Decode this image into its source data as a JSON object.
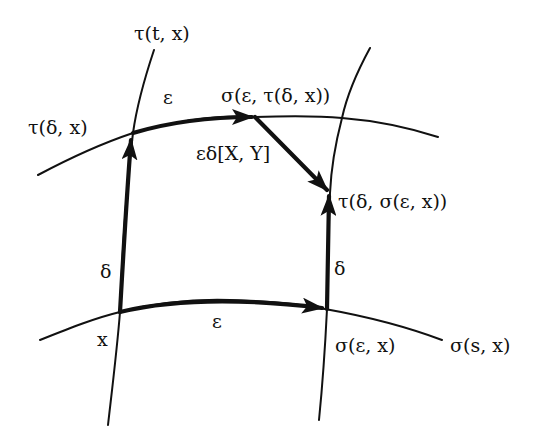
{
  "diagram": {
    "title": "",
    "colors": {
      "ink": "#111111",
      "background": "#ffffff"
    },
    "labels": {
      "tau_t_x": "τ(t, x)",
      "tau_delta_x": "τ(δ, x)",
      "eps_top": "ε",
      "sigma_eps_tau": "σ(ε, τ(δ, x))",
      "bracket": "εδ[X, Y]",
      "tau_delta_sigma": "τ(δ, σ(ε, x))",
      "delta_left": "δ",
      "delta_right": "δ",
      "eps_bottom": "ε",
      "x": "x",
      "sigma_eps_x": "σ(ε, x)",
      "sigma_s_x": "σ(s, x)"
    },
    "nodes": [
      {
        "id": "x",
        "label": "x"
      },
      {
        "id": "tau_delta_x",
        "label": "τ(δ, x)"
      },
      {
        "id": "sigma_eps_x",
        "label": "σ(ε, x)"
      },
      {
        "id": "sigma_eps_tau_delta_x",
        "label": "σ(ε, τ(δ, x))"
      },
      {
        "id": "tau_delta_sigma_eps_x",
        "label": "τ(δ, σ(ε, x))"
      }
    ],
    "curves": [
      {
        "id": "tau_curve_left",
        "label": "τ(t, x)",
        "style": "thin"
      },
      {
        "id": "tau_curve_right",
        "label": "",
        "style": "thin"
      },
      {
        "id": "upper_sigma_curve",
        "label": "τ(δ, x)",
        "style": "thin"
      },
      {
        "id": "sigma_curve_lower",
        "label": "σ(s, x)",
        "style": "thin"
      }
    ],
    "edges": [
      {
        "from": "x",
        "to": "tau_delta_x",
        "label": "δ",
        "style": "thick-arrow"
      },
      {
        "from": "tau_delta_x",
        "to": "sigma_eps_tau_delta_x",
        "label": "ε",
        "style": "thick-arrow"
      },
      {
        "from": "x",
        "to": "sigma_eps_x",
        "label": "ε",
        "style": "thick-arrow"
      },
      {
        "from": "sigma_eps_x",
        "to": "tau_delta_sigma_eps_x",
        "label": "δ",
        "style": "thick-arrow"
      },
      {
        "from": "sigma_eps_tau_delta_x",
        "to": "tau_delta_sigma_eps_x",
        "label": "εδ[X, Y]",
        "style": "thick-arrow"
      }
    ]
  }
}
